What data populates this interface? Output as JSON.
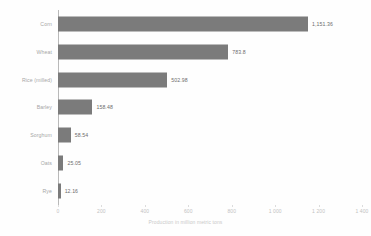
{
  "chart_data": {
    "type": "bar",
    "orientation": "horizontal",
    "title": "",
    "subtitle": "",
    "xlabel": "Production in million metric tons",
    "ylabel": "",
    "categories": [
      "Corn",
      "Wheat",
      "Rice (milled)",
      "Barley",
      "Sorghum",
      "Oats",
      "Rye"
    ],
    "values": [
      1151.36,
      783.8,
      502.98,
      158.48,
      58.54,
      25.05,
      12.16
    ],
    "value_labels": [
      "1,151.36",
      "783.8",
      "502.98",
      "158.48",
      "58.54",
      "25.05",
      "12.16"
    ],
    "xlim": [
      0,
      1400
    ],
    "x_ticks": [
      0,
      200,
      400,
      600,
      800,
      1000,
      1200,
      1400
    ],
    "x_tick_labels": [
      "0",
      "200",
      "400",
      "600",
      "800",
      "1 000",
      "1 200",
      "1 400"
    ],
    "grid": false,
    "legend": "none",
    "bar_color": "#7b7b7b",
    "background_color": "#fefefe",
    "axis_color": "#b9b9b9",
    "label_color": "#a6a6a6",
    "value_label_color": "#6d6d6d",
    "tick_label_color": "#c2c2c2"
  }
}
